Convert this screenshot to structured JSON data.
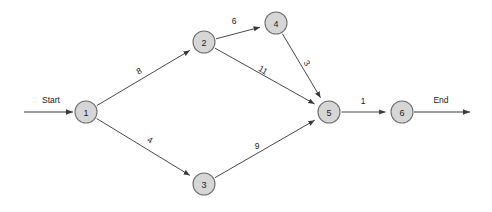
{
  "diagram": {
    "type": "directed-graph",
    "canvas": {
      "width": 492,
      "height": 212
    },
    "style": {
      "node_fill": "#d6d6d6",
      "node_stroke": "#6e6e6e",
      "edge_stroke": "#4a4a4a",
      "background": "#ffffff"
    },
    "nodes": [
      {
        "id": "1",
        "label": "1",
        "x": 86,
        "y": 112,
        "r": 11
      },
      {
        "id": "2",
        "label": "2",
        "x": 204,
        "y": 42,
        "r": 11
      },
      {
        "id": "3",
        "label": "3",
        "x": 204,
        "y": 184,
        "r": 11
      },
      {
        "id": "4",
        "label": "4",
        "x": 276,
        "y": 23,
        "r": 11
      },
      {
        "id": "5",
        "label": "5",
        "x": 329,
        "y": 112,
        "r": 11
      },
      {
        "id": "6",
        "label": "6",
        "x": 402,
        "y": 112,
        "r": 11
      }
    ],
    "edges": [
      {
        "from": "1",
        "to": "2",
        "weight": "8",
        "lx": 139,
        "ly": 71,
        "rot": -30.7
      },
      {
        "from": "1",
        "to": "3",
        "weight": "4",
        "lx": 150,
        "ly": 140,
        "rot": 30.7
      },
      {
        "from": "2",
        "to": "4",
        "weight": "6",
        "lx": 234,
        "ly": 21,
        "rot": 0
      },
      {
        "from": "2",
        "to": "5",
        "weight": "11",
        "lx": 263,
        "ly": 70,
        "rot": 30.6
      },
      {
        "from": "4",
        "to": "5",
        "weight": "3",
        "lx": 307,
        "ly": 63,
        "rot": 59.2
      },
      {
        "from": "3",
        "to": "5",
        "weight": "9",
        "lx": 257,
        "ly": 146,
        "rot": 0
      },
      {
        "from": "5",
        "to": "6",
        "weight": "1",
        "lx": 363,
        "ly": 101,
        "rot": 0
      }
    ],
    "terminals": [
      {
        "name": "start",
        "label": "Start",
        "label_x": 51,
        "label_y": 100,
        "line_x1": 24,
        "line_y1": 112,
        "line_x2": 73,
        "line_y2": 112
      },
      {
        "name": "end",
        "label": "End",
        "label_x": 441,
        "label_y": 100,
        "line_x1": 414,
        "line_y1": 112,
        "line_x2": 470,
        "line_y2": 112
      }
    ]
  }
}
